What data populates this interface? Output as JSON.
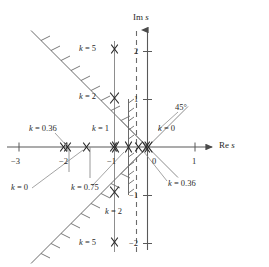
{
  "figure": {
    "type": "root-locus-s-plane",
    "axis_labels": {
      "real": "Re s",
      "imag": "Im s"
    },
    "angle_annotation": "45°"
  },
  "chart_data": {
    "type": "scatter",
    "title": "",
    "subtitle": "",
    "xlabel": "Re s",
    "ylabel": "Im s",
    "xlim": [
      -3.25,
      1.45
    ],
    "ylim": [
      -2.35,
      2.45
    ],
    "xticks": [
      -3,
      -2,
      -1,
      0,
      1
    ],
    "xtick_labels": [
      "−3",
      "−2",
      "−1",
      "0",
      "1"
    ],
    "yticks": [
      -2,
      -1,
      1,
      2
    ],
    "ytick_labels": [
      "−2",
      "−1",
      "1",
      "2"
    ],
    "grid": false,
    "legend": "none",
    "markers": [
      {
        "label": "x-mark",
        "x": -2.15,
        "y": 0
      },
      {
        "label": "x-mark",
        "x": -1.98,
        "y": 0
      },
      {
        "label": "x-mark",
        "x": -1.76,
        "y": 0
      },
      {
        "label": "x-mark",
        "x": -1.04,
        "y": 0
      },
      {
        "label": "x-mark",
        "x": -0.98,
        "y": 0
      },
      {
        "label": "x-mark",
        "x": -0.4,
        "y": 0
      },
      {
        "label": "x-mark",
        "x": -0.22,
        "y": 0
      },
      {
        "label": "x-mark",
        "x": -0.06,
        "y": 0
      },
      {
        "label": "x-mark",
        "x": 0.01,
        "y": 0
      },
      {
        "label": "x-mark",
        "x": -1.0,
        "y": 1.95
      },
      {
        "label": "x-mark",
        "x": -1.0,
        "y": 0.97
      },
      {
        "label": "x-mark",
        "x": -1.0,
        "y": -0.97
      },
      {
        "label": "x-mark",
        "x": -1.0,
        "y": -1.95
      }
    ],
    "annotations": [
      {
        "text": "k = 5",
        "x": -1.45,
        "y": 1.95,
        "target": [
          -1.0,
          1.95
        ]
      },
      {
        "text": "k = 2",
        "x": -1.45,
        "y": 0.99,
        "target": [
          -1.0,
          0.97
        ]
      },
      {
        "text": "k = 0.36",
        "x": -2.3,
        "y": 0.45,
        "target": [
          -2.05,
          0.0
        ]
      },
      {
        "text": "k = 1",
        "x": -1.2,
        "y": 0.45,
        "target": [
          -1.0,
          0.0
        ]
      },
      {
        "text": "k = 0",
        "x": -0.12,
        "y": 0.45,
        "target": [
          -0.02,
          0.0
        ]
      },
      {
        "text": "45°",
        "x": 0.28,
        "y": 0.85,
        "target": [
          0.0,
          0.0
        ]
      },
      {
        "text": "k = 0",
        "x": -2.75,
        "y": -0.62,
        "target": [
          -1.85,
          0.0
        ]
      },
      {
        "text": "k = 0.75",
        "x": -1.95,
        "y": -0.62,
        "target": [
          -0.6,
          0.0
        ]
      },
      {
        "text": "k = 0.36",
        "x": 0.06,
        "y": -0.62,
        "target": [
          -0.25,
          0.0
        ]
      },
      {
        "text": "k = 2",
        "x": -0.85,
        "y": -1.28,
        "target": [
          -1.0,
          -0.97
        ]
      },
      {
        "text": "k = 5",
        "x": -1.45,
        "y": -1.95,
        "target": [
          -1.0,
          -1.95
        ]
      }
    ],
    "lines": [
      {
        "name": "vertical-locus-branch-re-minus-1",
        "style": "solid-light",
        "from": [
          -1.0,
          2.2
        ],
        "to": [
          -1.0,
          -2.2
        ]
      },
      {
        "name": "asymptote-45-up-left",
        "style": "solid-hatched",
        "from": [
          0.0,
          0.0
        ],
        "to": [
          -2.45,
          2.45
        ]
      },
      {
        "name": "asymptote-45-down-left",
        "style": "solid-hatched",
        "from": [
          0.0,
          0.0
        ],
        "to": [
          -2.45,
          -2.45
        ]
      },
      {
        "name": "asymptote-45-up-right",
        "style": "solid-light",
        "from": [
          -0.55,
          -0.55
        ],
        "to": [
          0.85,
          0.85
        ]
      },
      {
        "name": "asymptote-45-down-right",
        "style": "solid-light",
        "from": [
          -0.55,
          0.55
        ],
        "to": [
          0.6,
          -0.6
        ]
      },
      {
        "name": "damping-boundary-dashed",
        "style": "dashed",
        "from": [
          -0.23,
          2.45
        ],
        "to": [
          -0.23,
          -2.35
        ]
      },
      {
        "name": "stability-boundary-hatched",
        "style": "solid-hatched-vertical",
        "from": [
          -0.4,
          1.0
        ],
        "to": [
          -0.4,
          -1.0
        ]
      },
      {
        "name": "tick-drop-minus-2",
        "style": "solid-light",
        "from": [
          -1.95,
          0.0
        ],
        "to": [
          -1.95,
          -0.45
        ]
      },
      {
        "name": "tick-drop-minus-1p5",
        "style": "solid-light",
        "from": [
          -1.52,
          0.0
        ],
        "to": [
          -1.52,
          -0.55
        ]
      }
    ]
  }
}
